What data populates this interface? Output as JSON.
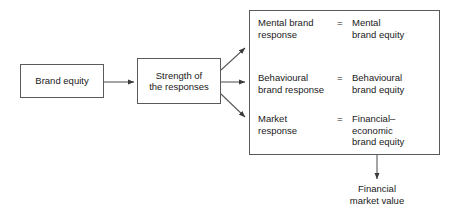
{
  "diagram": {
    "line_color": "#5a5a5a",
    "text_color": "#1a1a1a",
    "background": "#ffffff"
  },
  "nodes": {
    "brand_equity": "Brand equity",
    "strength_of_responses": "Strength of\nthe responses",
    "financial_market_value": "Financial\nmarket value"
  },
  "equations": [
    {
      "response": "Mental brand\nresponse",
      "operator": "=",
      "equity": "Mental\nbrand equity"
    },
    {
      "response": "Behavioural\nbrand response",
      "operator": "=",
      "equity": "Behavioural\nbrand equity"
    },
    {
      "response": "Market\nresponse",
      "operator": "=",
      "equity": "Financial–\neconomic\nbrand equity"
    }
  ],
  "connectors": [
    {
      "name": "brand-equity-to-strength",
      "style": "arrow-right"
    },
    {
      "name": "strength-to-mental",
      "style": "arrow-up-right"
    },
    {
      "name": "strength-to-behavioural",
      "style": "arrow-right"
    },
    {
      "name": "strength-to-market",
      "style": "arrow-down-right"
    },
    {
      "name": "responses-to-financial-market-value",
      "style": "arrow-down"
    }
  ]
}
